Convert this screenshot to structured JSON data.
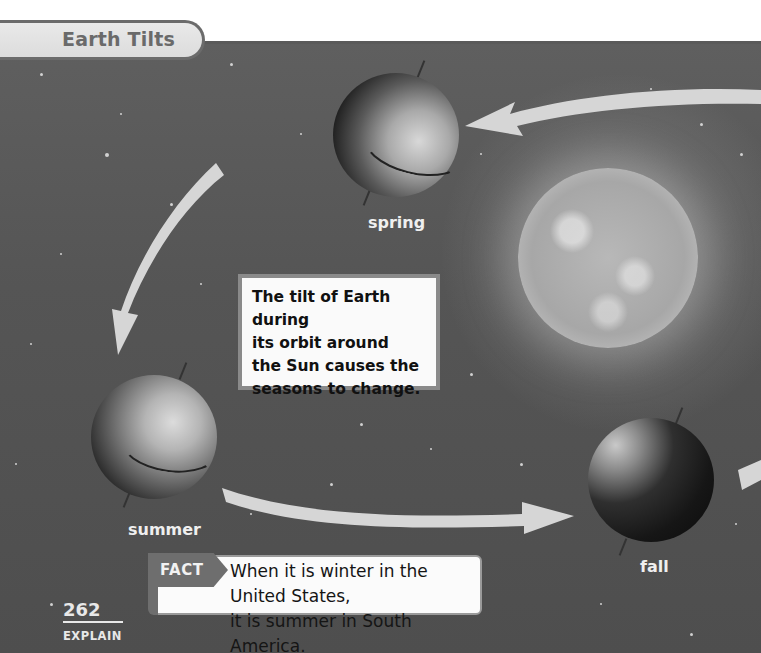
{
  "page": {
    "title": "Earth Tilts",
    "page_number": "262",
    "section": "EXPLAIN"
  },
  "diagram": {
    "sun_label": "",
    "positions": [
      {
        "season": "spring",
        "label": "spring"
      },
      {
        "season": "summer",
        "label": "summer"
      },
      {
        "season": "fall",
        "label": "fall"
      }
    ],
    "arrows": [
      "orbit-arrow-top",
      "orbit-arrow-left",
      "orbit-arrow-bottom",
      "orbit-arrow-right-edge"
    ]
  },
  "callout": {
    "text": "The tilt of Earth during\nits orbit around\nthe Sun causes the\nseasons to change."
  },
  "fact": {
    "label": "FACT",
    "text": "When it is winter in the United States,\nit is summer in South America."
  },
  "colors": {
    "background": "#565656",
    "title_tab": "#e2e2e2",
    "title_text": "#6a6a6a",
    "arrow": "#d6d6d6",
    "callout_border": "#8a8a8a",
    "fact_tag": "#6e6e6e"
  }
}
